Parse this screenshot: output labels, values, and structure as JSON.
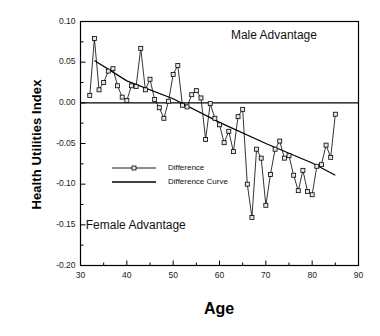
{
  "chart_data": {
    "type": "line",
    "title": "",
    "xlabel": "Age",
    "ylabel": "Health Utilities Index",
    "xlim": [
      30,
      90
    ],
    "ylim": [
      -0.2,
      0.1
    ],
    "grid": false,
    "legend_position": "center-left",
    "x_ticks": [
      30,
      40,
      50,
      60,
      70,
      80,
      90
    ],
    "x_tick_labels": [
      "30",
      "40",
      "50",
      "60",
      "70",
      "80",
      "90"
    ],
    "x_minor_ticks": [
      35,
      45,
      55,
      65,
      75,
      85
    ],
    "y_ticks": [
      0.1,
      0.05,
      0.0,
      -0.05,
      -0.1,
      -0.15,
      -0.2
    ],
    "y_tick_labels": [
      "0.10",
      "0.05",
      "0.00",
      "-0.05",
      "-0.10",
      "-0.15",
      "-0.20"
    ],
    "y_minor_ticks": [
      0.075,
      0.025,
      -0.025,
      -0.075,
      -0.125,
      -0.175
    ],
    "zero_line": 0.0,
    "annotations": [
      {
        "text": "Male  Advantage",
        "x": 72.5,
        "y": 0.082
      },
      {
        "text": "Female  Advantage",
        "x": 42.5,
        "y": -0.152
      }
    ],
    "legend": [
      {
        "name": "Difference",
        "marker": "square",
        "line": "solid"
      },
      {
        "name": "Difference Curve",
        "marker": "none",
        "line": "solid"
      }
    ],
    "series": [
      {
        "name": "Difference",
        "marker": "square",
        "x": [
          32,
          33,
          34,
          35,
          36,
          37,
          38,
          39,
          40,
          41,
          42,
          43,
          44,
          45,
          46,
          47,
          48,
          49,
          50,
          51,
          52,
          53,
          54,
          55,
          56,
          57,
          58,
          59,
          60,
          61,
          62,
          63,
          64,
          65,
          66,
          67,
          68,
          69,
          70,
          71,
          72,
          73,
          74,
          75,
          76,
          77,
          78,
          79,
          80,
          81,
          82,
          83,
          84,
          85
        ],
        "values": [
          0.009,
          0.079,
          0.016,
          0.025,
          0.039,
          0.042,
          0.021,
          0.007,
          0.003,
          0.021,
          0.02,
          0.067,
          0.016,
          0.029,
          0.004,
          -0.006,
          -0.019,
          0.002,
          0.035,
          0.046,
          -0.003,
          -0.005,
          0.01,
          0.015,
          0.006,
          -0.045,
          -0.001,
          -0.019,
          -0.027,
          -0.049,
          -0.035,
          -0.06,
          -0.017,
          -0.008,
          -0.1,
          -0.141,
          -0.057,
          -0.068,
          -0.126,
          -0.088,
          -0.057,
          -0.047,
          -0.068,
          -0.065,
          -0.089,
          -0.108,
          -0.083,
          -0.109,
          -0.113,
          -0.078,
          -0.076,
          -0.052,
          -0.067,
          -0.014
        ]
      },
      {
        "name": "Difference Curve",
        "marker": "none",
        "x": [
          33,
          40,
          50,
          60,
          70,
          80,
          85
        ],
        "values": [
          0.052,
          0.027,
          0.005,
          -0.024,
          -0.05,
          -0.074,
          -0.089
        ]
      }
    ]
  },
  "figure": {
    "axis_title_x": "Age",
    "axis_title_y": "Health Utilities Index"
  }
}
